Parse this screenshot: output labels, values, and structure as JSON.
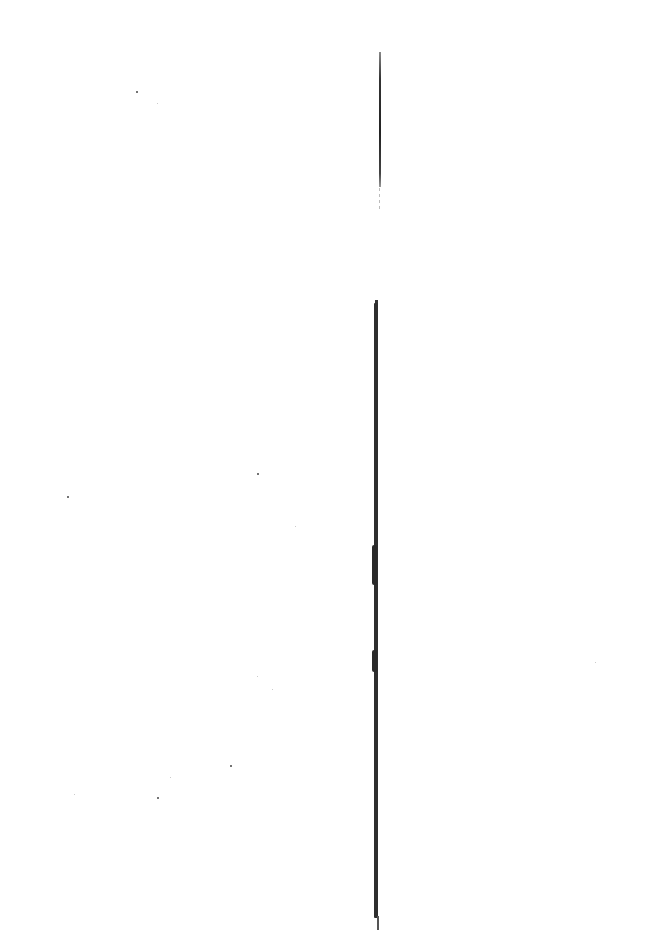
{
  "document": {
    "type": "scanned-page",
    "background_color": "#ffffff",
    "text": "",
    "rules": [
      {
        "name": "upper-thin-rule",
        "orientation": "vertical",
        "x": 380,
        "y_start": 52,
        "y_end": 210,
        "color": "#222222"
      },
      {
        "name": "lower-thick-rule",
        "orientation": "vertical",
        "x": 376,
        "y_start": 300,
        "y_end": 930,
        "color": "#2e2e2e"
      }
    ],
    "specks": [
      {
        "x": 136,
        "y": 91
      },
      {
        "x": 257,
        "y": 473
      },
      {
        "x": 67,
        "y": 496
      },
      {
        "x": 295,
        "y": 526,
        "faint": true
      },
      {
        "x": 230,
        "y": 765
      },
      {
        "x": 157,
        "y": 797
      },
      {
        "x": 257,
        "y": 676,
        "faint": true
      },
      {
        "x": 272,
        "y": 689,
        "faint": true
      },
      {
        "x": 170,
        "y": 777,
        "faint": true
      },
      {
        "x": 74,
        "y": 794,
        "faint": true
      },
      {
        "x": 157,
        "y": 103,
        "faint": true
      },
      {
        "x": 595,
        "y": 662,
        "faint": true
      }
    ]
  }
}
